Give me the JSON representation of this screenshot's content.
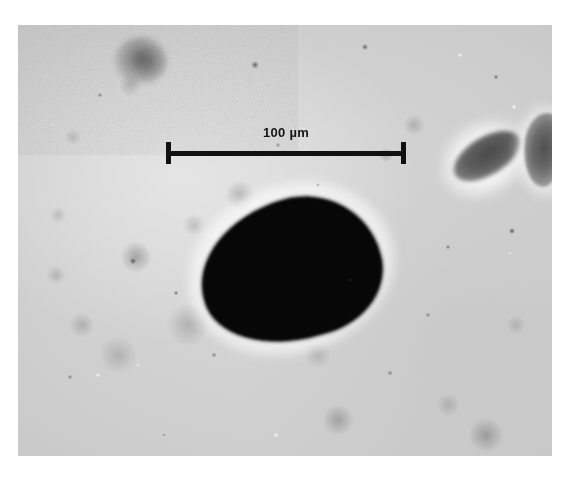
{
  "figure": {
    "kind": "light-microscopy-micrograph"
  },
  "scalebar": {
    "label": "100 µm",
    "value": "100",
    "unit": "µm",
    "bar_color": "#111111",
    "text_color": "#151515",
    "left_px": 166,
    "right_px": 406,
    "length_px": 240,
    "baseline_y_px": 152
  },
  "field": {
    "background_color": "#cfcfcf",
    "border_margin_color": "#ffffff",
    "left_px": 18,
    "top_px": 25,
    "width_px": 534,
    "height_px": 431
  },
  "objects": {
    "organism": {
      "name": "dark ovoid body",
      "color": "#070707",
      "center_x_px": 290,
      "center_y_px": 270,
      "width_px": 181,
      "height_px": 139,
      "rotation_deg": -16
    },
    "bean": {
      "name": "elongated diagonal structure",
      "color": "#5e5e5e",
      "center_x_px": 487,
      "center_y_px": 156,
      "rotation_deg": -31
    },
    "edge_mass": {
      "name": "irregular cluster at right margin",
      "color": "#5f5f5f",
      "center_x_px": 545,
      "center_y_px": 150
    },
    "upper_left_blob": {
      "name": "diffuse dark blob",
      "color": "#6e6e6e",
      "center_x_px": 141,
      "center_y_px": 61
    }
  }
}
